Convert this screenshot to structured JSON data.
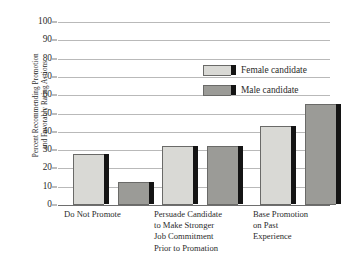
{
  "chart_data": {
    "type": "bar",
    "title": "",
    "xlabel": "",
    "ylabel_lines": [
      "Percent Recommending Promotion",
      "and Favorably Rating Actions"
    ],
    "ylabel": "Percent Recommending Promotion and Favorably Rating Actions",
    "ylim": [
      0,
      100
    ],
    "yticks": [
      0,
      10,
      20,
      30,
      40,
      50,
      60,
      70,
      80,
      90,
      100
    ],
    "ytick_labels": [
      "0",
      "10",
      "20",
      "30",
      "40",
      "50",
      "60",
      "70",
      "80",
      "90",
      "100"
    ],
    "grid": true,
    "legend_position": "upper center",
    "categories": [
      {
        "lines": [
          "Do Not Promote"
        ]
      },
      {
        "lines": [
          "Persuade Candidate",
          "to Make Stronger",
          "Job Commitment",
          "Prior to Promation"
        ]
      },
      {
        "lines": [
          "Base Promotion",
          "on Past",
          "Experience"
        ]
      }
    ],
    "category_labels": [
      "Do Not Promote",
      "Persuade Candidate to Make Stronger Job Commitment Prior to Promation",
      "Base Promotion on Past Experience"
    ],
    "series": [
      {
        "name": "Female candidate",
        "color": "#d9d9d5",
        "values": [
          28,
          32,
          43
        ]
      },
      {
        "name": "Male candidate",
        "color": "#9b9b97",
        "values": [
          12.5,
          32.5,
          55
        ]
      }
    ]
  },
  "legend": {
    "items": [
      {
        "label": "Female candidate",
        "swatch": "female"
      },
      {
        "label": "Male candidate",
        "swatch": "male"
      }
    ]
  },
  "caption": ""
}
